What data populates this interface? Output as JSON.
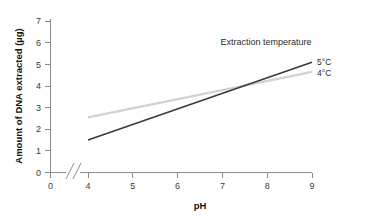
{
  "chart_data": {
    "type": "line",
    "title": "",
    "xlabel": "pH",
    "ylabel": "Amount of DNA extracted (µg)",
    "xlim": [
      4,
      9
    ],
    "ylim": [
      0,
      7
    ],
    "grid": false,
    "legend_position": "right-inside",
    "legend_title": "Extraction temperature",
    "x_ticks": [
      "0",
      "4",
      "5",
      "6",
      "7",
      "8",
      "9"
    ],
    "y_ticks": [
      "0",
      "1",
      "2",
      "3",
      "4",
      "5",
      "6",
      "7"
    ],
    "axis_break": true,
    "x": [
      4,
      9
    ],
    "series": [
      {
        "name": "5°C",
        "color": "#3a3a3a",
        "values": [
          1.5,
          5.1
        ]
      },
      {
        "name": "4°C",
        "color": "#d2d2d2",
        "values": [
          2.55,
          4.65
        ]
      }
    ]
  },
  "axis": {
    "y_label": "Amount of DNA extracted (µg)",
    "x_label": "pH",
    "y_tick_0": "0",
    "y_tick_1": "1",
    "y_tick_2": "2",
    "y_tick_3": "3",
    "y_tick_4": "4",
    "y_tick_5": "5",
    "y_tick_6": "6",
    "y_tick_7": "7",
    "x_tick_origin": "0",
    "x_tick_4": "4",
    "x_tick_5": "5",
    "x_tick_6": "6",
    "x_tick_7": "7",
    "x_tick_8": "8",
    "x_tick_9": "9"
  },
  "legend": {
    "title": "Extraction temperature",
    "item_warm": "5°C",
    "item_cool": "4°C"
  },
  "colors": {
    "series_warm": "#3a3a3a",
    "series_cool": "#d2d2d2",
    "axis": "#8a8a8a",
    "text": "#2b2b2b",
    "background": "#ffffff"
  }
}
